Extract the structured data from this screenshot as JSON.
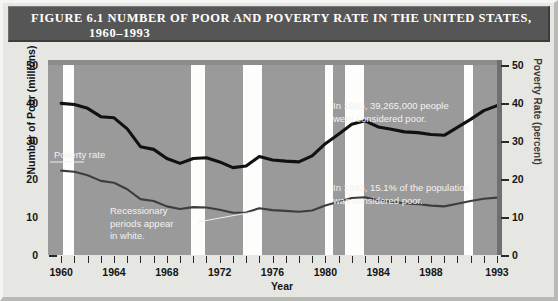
{
  "figure": {
    "title_line1": "FIGURE 6.1   NUMBER OF POOR AND POVERTY RATE IN THE UNITED STATES,",
    "title_line2": "1960–1993"
  },
  "annotations": {
    "count_line1": "In 1993, 39,265,000 people",
    "count_line2": "were considered poor.",
    "rate_line1": "In 1993, 15.1% of the population",
    "rate_line2": "was considered poor.",
    "recession_line1": "Recessionary",
    "recession_line2": "periods appear",
    "recession_line3": "in white.",
    "poverty_rate_label": "Poverty rate"
  },
  "chart_data": {
    "type": "line",
    "title": "FIGURE 6.1   NUMBER OF POOR AND POVERTY RATE IN THE UNITED STATES, 1960–1993",
    "xlabel": "Year",
    "ylabel": "Number of Poor (millions)",
    "ylabel_right": "Poverty Rate (percent)",
    "ylim": [
      0,
      50
    ],
    "ylim_right": [
      0,
      50
    ],
    "xlim": [
      1959,
      1993
    ],
    "grid": false,
    "legend_position": "inline-annotations",
    "yticks": [
      0,
      10,
      20,
      30,
      40,
      50
    ],
    "yticks_right": [
      0,
      10,
      20,
      30,
      40,
      50
    ],
    "xticks": [
      1960,
      1964,
      1968,
      1972,
      1976,
      1980,
      1984,
      1988,
      1993
    ],
    "xtick_all_years": [
      1960,
      1961,
      1962,
      1963,
      1964,
      1965,
      1966,
      1967,
      1968,
      1969,
      1970,
      1971,
      1972,
      1973,
      1974,
      1975,
      1976,
      1977,
      1978,
      1979,
      1980,
      1981,
      1982,
      1983,
      1984,
      1985,
      1986,
      1987,
      1988,
      1989,
      1990,
      1991,
      1992,
      1993
    ],
    "x": [
      1960,
      1961,
      1962,
      1963,
      1964,
      1965,
      1966,
      1967,
      1968,
      1969,
      1970,
      1971,
      1972,
      1973,
      1974,
      1975,
      1976,
      1977,
      1978,
      1979,
      1980,
      1981,
      1982,
      1983,
      1984,
      1985,
      1986,
      1987,
      1988,
      1989,
      1990,
      1991,
      1992,
      1993
    ],
    "series": [
      {
        "name": "Number of Poor (millions)",
        "axis": "left",
        "color": "#111111",
        "values": [
          39.9,
          39.6,
          38.6,
          36.4,
          36.1,
          33.2,
          28.5,
          27.8,
          25.4,
          24.1,
          25.4,
          25.6,
          24.5,
          23.0,
          23.4,
          25.9,
          25.0,
          24.7,
          24.5,
          26.1,
          29.3,
          31.8,
          34.4,
          35.3,
          33.7,
          33.1,
          32.4,
          32.2,
          31.7,
          31.5,
          33.6,
          35.7,
          38.0,
          39.3
        ]
      },
      {
        "name": "Poverty rate (percent)",
        "axis": "right",
        "color": "#3d3d3d",
        "values": [
          22.2,
          21.9,
          21.0,
          19.5,
          19.0,
          17.3,
          14.7,
          14.2,
          12.8,
          12.1,
          12.6,
          12.5,
          11.9,
          11.1,
          11.2,
          12.3,
          11.8,
          11.6,
          11.4,
          11.7,
          13.0,
          14.0,
          15.0,
          15.2,
          14.4,
          14.0,
          13.6,
          13.4,
          13.0,
          12.8,
          13.5,
          14.2,
          14.8,
          15.1
        ]
      }
    ],
    "recession_bands": [
      {
        "start": 1960.1,
        "end": 1961.0
      },
      {
        "start": 1969.8,
        "end": 1970.9
      },
      {
        "start": 1973.8,
        "end": 1975.2
      },
      {
        "start": 1980.0,
        "end": 1980.6
      },
      {
        "start": 1981.5,
        "end": 1982.9
      },
      {
        "start": 1990.5,
        "end": 1991.2
      }
    ],
    "recession_band_note": "Recessionary periods appear in white."
  },
  "colors": {
    "titlebar_bg": "#565656",
    "titlebar_text": "#ffffff",
    "page_bg": "#e6e6e3",
    "plot_bg": "#9a9a9a",
    "band": "#fdfdfb",
    "count_line": "#111111",
    "rate_line": "#3d3d3d"
  }
}
